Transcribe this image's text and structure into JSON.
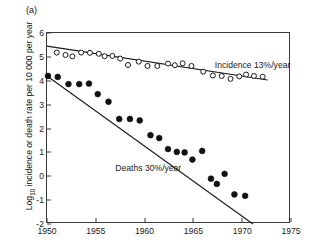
{
  "figure": {
    "panel_label": "(a)"
  },
  "chart_data": {
    "type": "scatter",
    "title": "",
    "xlabel": "",
    "ylabel_parts": {
      "pre": "Log",
      "sub": "10",
      "post": " incidence or death rate per 10 000 per year"
    },
    "ylabel": "Log10 incidence or death rate per 10 000 per year",
    "xlim": [
      1950,
      1975
    ],
    "ylim": [
      -2,
      6
    ],
    "xticks": [
      1950,
      1955,
      1960,
      1965,
      1970,
      1975
    ],
    "xtick_labels": [
      "1950",
      "1955",
      "1960",
      "1965",
      "1970",
      "1975"
    ],
    "yticks": [
      -2,
      -1,
      0,
      1,
      2,
      3,
      4,
      5,
      6
    ],
    "ytick_labels": [
      "-2",
      "-1",
      "0",
      "1",
      "2",
      "3",
      "4",
      "5",
      "6"
    ],
    "grid": false,
    "legend_position": "inline-annotations",
    "frame": "box",
    "series": [
      {
        "name": "Incidence",
        "annotation": "Incidence 13%/year",
        "annotation_x": 1967.2,
        "annotation_y": 4.62,
        "marker": "open-circle",
        "marker_color": "#ffffff",
        "marker_edge_color": "#1a1a1a",
        "trend": {
          "x0": 1950.0,
          "y0": 5.45,
          "x1": 1972.6,
          "y1": 4.03
        },
        "points": [
          {
            "x": 1951.0,
            "y": 5.18
          },
          {
            "x": 1951.9,
            "y": 5.08
          },
          {
            "x": 1952.6,
            "y": 5.02
          },
          {
            "x": 1953.5,
            "y": 5.18
          },
          {
            "x": 1954.4,
            "y": 5.17
          },
          {
            "x": 1955.3,
            "y": 5.13
          },
          {
            "x": 1955.9,
            "y": 5.03
          },
          {
            "x": 1956.7,
            "y": 5.04
          },
          {
            "x": 1957.5,
            "y": 4.93
          },
          {
            "x": 1958.3,
            "y": 4.66
          },
          {
            "x": 1959.4,
            "y": 4.8
          },
          {
            "x": 1960.3,
            "y": 4.62
          },
          {
            "x": 1961.3,
            "y": 4.62
          },
          {
            "x": 1962.4,
            "y": 4.72
          },
          {
            "x": 1963.1,
            "y": 4.65
          },
          {
            "x": 1963.9,
            "y": 4.73
          },
          {
            "x": 1964.8,
            "y": 4.62
          },
          {
            "x": 1966.0,
            "y": 4.38
          },
          {
            "x": 1967.0,
            "y": 4.22
          },
          {
            "x": 1967.9,
            "y": 4.2
          },
          {
            "x": 1968.8,
            "y": 4.08
          },
          {
            "x": 1969.7,
            "y": 4.18
          },
          {
            "x": 1970.4,
            "y": 4.26
          },
          {
            "x": 1971.2,
            "y": 4.2
          },
          {
            "x": 1972.1,
            "y": 4.17
          }
        ]
      },
      {
        "name": "Deaths",
        "annotation": "Deaths 30%/year",
        "annotation_x": 1957.0,
        "annotation_y": 0.3,
        "marker": "filled-circle",
        "marker_color": "#111111",
        "marker_edge_color": "#111111",
        "trend": {
          "x0": 1950.0,
          "y0": 4.2,
          "x1": 1971.1,
          "y1": -2.0
        },
        "points": [
          {
            "x": 1950.1,
            "y": 4.2
          },
          {
            "x": 1951.1,
            "y": 4.16
          },
          {
            "x": 1952.2,
            "y": 3.86
          },
          {
            "x": 1953.3,
            "y": 3.86
          },
          {
            "x": 1954.3,
            "y": 3.88
          },
          {
            "x": 1955.2,
            "y": 3.44
          },
          {
            "x": 1956.3,
            "y": 3.12
          },
          {
            "x": 1957.4,
            "y": 2.4
          },
          {
            "x": 1958.5,
            "y": 2.4
          },
          {
            "x": 1959.5,
            "y": 2.34
          },
          {
            "x": 1960.6,
            "y": 1.72
          },
          {
            "x": 1961.5,
            "y": 1.6
          },
          {
            "x": 1962.4,
            "y": 1.14
          },
          {
            "x": 1963.3,
            "y": 1.02
          },
          {
            "x": 1964.1,
            "y": 1.0
          },
          {
            "x": 1964.9,
            "y": 0.7
          },
          {
            "x": 1965.9,
            "y": 1.06
          },
          {
            "x": 1966.8,
            "y": -0.1
          },
          {
            "x": 1967.4,
            "y": -0.32
          },
          {
            "x": 1968.2,
            "y": 0.1
          },
          {
            "x": 1969.2,
            "y": -0.76
          },
          {
            "x": 1970.3,
            "y": -0.82
          }
        ]
      }
    ]
  }
}
